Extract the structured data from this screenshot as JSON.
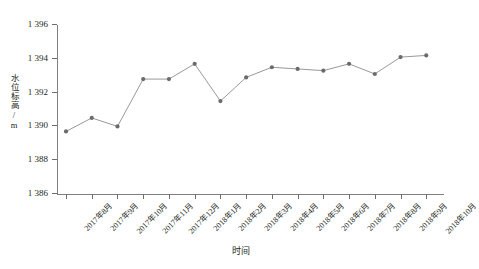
{
  "chart_data": {
    "type": "line",
    "title": "",
    "xlabel": "时间",
    "ylabel": "水位标高/m",
    "ylim": [
      1386,
      1396
    ],
    "ytick_step": 2,
    "yticks": [
      "1 386",
      "1 388",
      "1 390",
      "1 392",
      "1 394",
      "1 396"
    ],
    "ytick_values": [
      1386,
      1388,
      1390,
      1392,
      1394,
      1396
    ],
    "grid": false,
    "legend": "none",
    "marker": "circle",
    "line_color": "#8c8c8c",
    "marker_color": "#6b6b6b",
    "axis_color": "#808080",
    "categories": [
      "2017年8月",
      "2017年9月",
      "2017年10月",
      "2017年11月",
      "2017年12月",
      "2018年1月",
      "2018年2月",
      "2018年3月",
      "2018年4月",
      "2018年5月",
      "2018年6月",
      "2018年7月",
      "2018年8月",
      "2018年9月",
      "2018年10月"
    ],
    "values": [
      1389.7,
      1390.5,
      1390.0,
      1392.8,
      1392.8,
      1393.7,
      1391.5,
      1392.9,
      1393.5,
      1393.4,
      1393.3,
      1393.7,
      1393.1,
      1394.1,
      1394.2
    ],
    "series": [
      {
        "name": "水位标高",
        "values": [
          1389.7,
          1390.5,
          1390.0,
          1392.8,
          1392.8,
          1393.7,
          1391.5,
          1392.9,
          1393.5,
          1393.4,
          1393.3,
          1393.7,
          1393.1,
          1394.1,
          1394.2
        ]
      }
    ]
  }
}
